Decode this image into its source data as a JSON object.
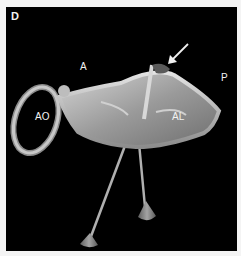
{
  "figure": {
    "panel_letter": "D",
    "labels": {
      "anterior": "A",
      "posterior": "P",
      "aorta": "AO",
      "anterior_leaflet": "AL"
    },
    "annotation": "arrow-pointing-to-leaflet-tip",
    "colors": {
      "background": "#000000",
      "surface": "#bcbcbc",
      "frame": "#f4f4f4"
    }
  }
}
